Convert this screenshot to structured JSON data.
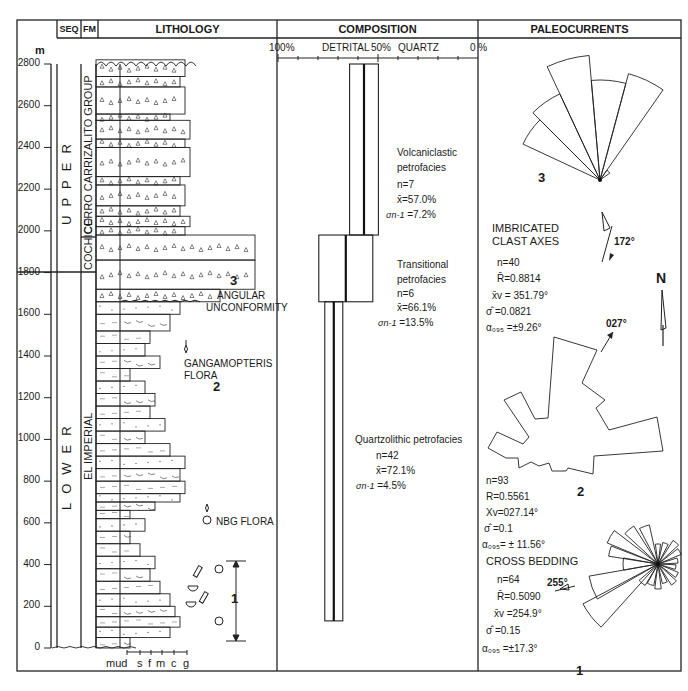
{
  "headers": {
    "seq": "SEQ",
    "fm": "FM",
    "lithology": "LITHOLOGY",
    "composition": "COMPOSITION",
    "paleocurrents": "PALEOCURRENTS"
  },
  "depth_axis": {
    "unit": "m",
    "ticks": [
      "2800",
      "2600",
      "2400",
      "2200",
      "2000",
      "1800",
      "1600",
      "1400",
      "1200",
      "1000",
      "800",
      "600",
      "400",
      "200",
      "0"
    ]
  },
  "sequences": [
    {
      "label": "UPPER",
      "from_m": 1660,
      "to_m": 2820
    },
    {
      "label": "LOWER",
      "from_m": 0,
      "to_m": 1660
    }
  ],
  "formations": [
    {
      "label": "CERRO CARRIZALITO GROUP",
      "from_m": 1980,
      "to_m": 2820
    },
    {
      "label": "COCHICO",
      "from_m": 1660,
      "to_m": 1980
    },
    {
      "label": "EL IMPERIAL",
      "from_m": 0,
      "to_m": 1660
    }
  ],
  "grain_size_scale": [
    "mud",
    "s",
    "f",
    "m",
    "c",
    "g"
  ],
  "lithology_annotations": {
    "angular_unconformity": {
      "number": "3",
      "line1": "ANGULAR",
      "line2": "UNCONFORMITY"
    },
    "gangamopteris": {
      "line1": "GANGAMOPTERIS",
      "line2": "FLORA",
      "number": "2"
    },
    "nbg_flora": "NBG FLORA",
    "interval_1": "1"
  },
  "composition": {
    "axis": {
      "left": "100%",
      "detrital": "DETRITAL",
      "mid": "50%",
      "quartz": "QUARTZ",
      "right": "0 %"
    },
    "petrofacies": [
      {
        "name": "Volcaniclastic",
        "line2": "petrofacies",
        "n": "n=7",
        "mean": "x̄=57.0%",
        "sd_label": "σn-1",
        "sd": "=7.2%",
        "mean_pct": 57.0,
        "sd_pct": 7.2,
        "from_m": 1980,
        "to_m": 2800
      },
      {
        "name": "Transitional",
        "line2": "petrofacies",
        "n": "n=6",
        "mean": "x̄=66.1%",
        "sd_label": "σn-1",
        "sd": "=13.5%",
        "mean_pct": 66.1,
        "sd_pct": 13.5,
        "from_m": 1660,
        "to_m": 1980
      },
      {
        "name": "Quartzolithic petrofacies",
        "line2": "",
        "n": "n=42",
        "mean": "x̄=72.1%",
        "sd_label": "σn-1",
        "sd": "=4.5%",
        "mean_pct": 72.1,
        "sd_pct": 4.5,
        "from_m": 130,
        "to_m": 1660
      }
    ]
  },
  "paleocurrents": {
    "rose3": {
      "number": "3",
      "title1": "IMBRICATED",
      "title2": "CLAST AXES",
      "n": "n=40",
      "R": "R̄=0.8814",
      "xv": "x̄v = 351.79°",
      "sigma": "σ̂  =0.0821",
      "alpha": "α₀₉₅ =±9.26°",
      "mean_arrow": "172°"
    },
    "rose2": {
      "number": "2",
      "n": "n=93",
      "R": "R=0.5561",
      "xv": "Xv=027.14°",
      "sigma": "σ̂  =0.1",
      "alpha": "α₀₉₅= ± 11.56°",
      "mean_arrow": "027°"
    },
    "rose1": {
      "number": "1",
      "title": "CROSS BEDDING",
      "n": "n=64",
      "R": "R̄=0.5090",
      "xv": "x̄v =254.9°",
      "sigma": "σ̂  =0.15",
      "alpha": "α₀₉₅ =±17.3°",
      "mean_arrow": "255°"
    },
    "north": "N"
  }
}
